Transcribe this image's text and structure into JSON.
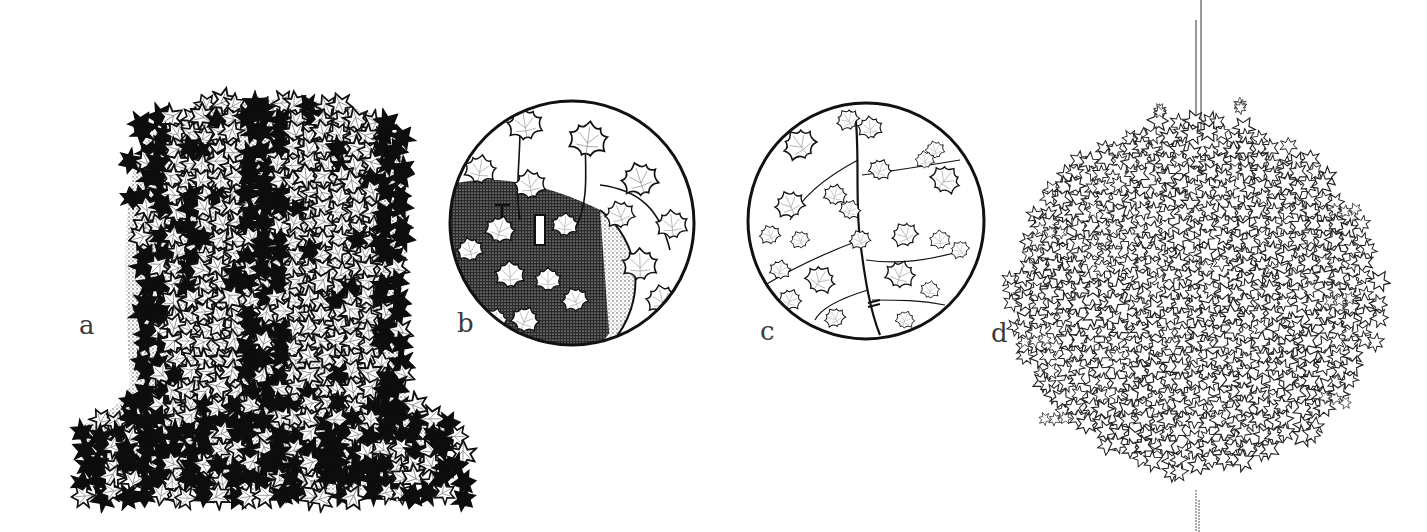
{
  "figure": {
    "panels": [
      {
        "id": "a",
        "label": "a",
        "subject": "ivy-topiary-bell-shape",
        "style": "dense-dark-leaves"
      },
      {
        "id": "b",
        "label": "b",
        "subject": "ivy-detail-pinned-to-moss-frame",
        "style": "circular-inset"
      },
      {
        "id": "c",
        "label": "c",
        "subject": "ivy-trailing-stem-detail",
        "style": "circular-inset"
      },
      {
        "id": "d",
        "label": "d",
        "subject": "ivy-hanging-ball-on-wire",
        "style": "light-outline-leaves"
      }
    ],
    "colors": {
      "ink": "#111111",
      "label": "#3a3a3a",
      "background": "#ffffff",
      "stipple": "#555555"
    }
  }
}
